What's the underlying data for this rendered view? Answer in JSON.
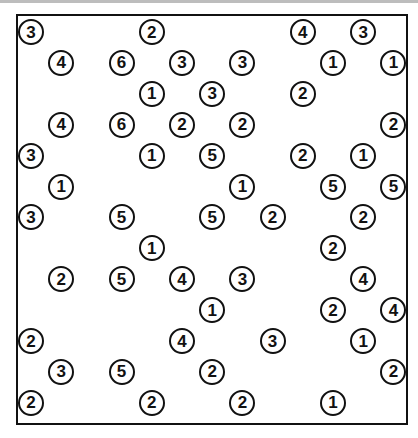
{
  "puzzle": {
    "type": "hashi",
    "rows": 13,
    "cols": 13,
    "origin_px": [
      30,
      31
    ],
    "step_px": [
      30.2,
      30.9
    ],
    "colors": {
      "border": "#111111",
      "background": "#ffffff",
      "island_text": "#111111"
    },
    "islands": [
      {
        "r": 0,
        "c": 0,
        "v": "3"
      },
      {
        "r": 0,
        "c": 4,
        "v": "2"
      },
      {
        "r": 0,
        "c": 9,
        "v": "4"
      },
      {
        "r": 0,
        "c": 11,
        "v": "3"
      },
      {
        "r": 1,
        "c": 1,
        "v": "4"
      },
      {
        "r": 1,
        "c": 3,
        "v": "6"
      },
      {
        "r": 1,
        "c": 5,
        "v": "3"
      },
      {
        "r": 1,
        "c": 7,
        "v": "3"
      },
      {
        "r": 1,
        "c": 10,
        "v": "1"
      },
      {
        "r": 1,
        "c": 12,
        "v": "1"
      },
      {
        "r": 2,
        "c": 4,
        "v": "1"
      },
      {
        "r": 2,
        "c": 6,
        "v": "3"
      },
      {
        "r": 2,
        "c": 9,
        "v": "2"
      },
      {
        "r": 3,
        "c": 1,
        "v": "4"
      },
      {
        "r": 3,
        "c": 3,
        "v": "6"
      },
      {
        "r": 3,
        "c": 5,
        "v": "2"
      },
      {
        "r": 3,
        "c": 7,
        "v": "2"
      },
      {
        "r": 3,
        "c": 12,
        "v": "2"
      },
      {
        "r": 4,
        "c": 0,
        "v": "3"
      },
      {
        "r": 4,
        "c": 4,
        "v": "1"
      },
      {
        "r": 4,
        "c": 6,
        "v": "5"
      },
      {
        "r": 4,
        "c": 9,
        "v": "2"
      },
      {
        "r": 4,
        "c": 11,
        "v": "1"
      },
      {
        "r": 5,
        "c": 1,
        "v": "1"
      },
      {
        "r": 5,
        "c": 7,
        "v": "1"
      },
      {
        "r": 5,
        "c": 10,
        "v": "5"
      },
      {
        "r": 5,
        "c": 12,
        "v": "5"
      },
      {
        "r": 6,
        "c": 0,
        "v": "3"
      },
      {
        "r": 6,
        "c": 3,
        "v": "5"
      },
      {
        "r": 6,
        "c": 6,
        "v": "5"
      },
      {
        "r": 6,
        "c": 8,
        "v": "2"
      },
      {
        "r": 6,
        "c": 11,
        "v": "2"
      },
      {
        "r": 7,
        "c": 4,
        "v": "1"
      },
      {
        "r": 7,
        "c": 10,
        "v": "2"
      },
      {
        "r": 8,
        "c": 1,
        "v": "2"
      },
      {
        "r": 8,
        "c": 3,
        "v": "5"
      },
      {
        "r": 8,
        "c": 5,
        "v": "4"
      },
      {
        "r": 8,
        "c": 7,
        "v": "3"
      },
      {
        "r": 8,
        "c": 11,
        "v": "4"
      },
      {
        "r": 9,
        "c": 6,
        "v": "1"
      },
      {
        "r": 9,
        "c": 10,
        "v": "2"
      },
      {
        "r": 9,
        "c": 12,
        "v": "4"
      },
      {
        "r": 10,
        "c": 0,
        "v": "2"
      },
      {
        "r": 10,
        "c": 5,
        "v": "4"
      },
      {
        "r": 10,
        "c": 8,
        "v": "3"
      },
      {
        "r": 10,
        "c": 11,
        "v": "1"
      },
      {
        "r": 11,
        "c": 1,
        "v": "3"
      },
      {
        "r": 11,
        "c": 3,
        "v": "5"
      },
      {
        "r": 11,
        "c": 6,
        "v": "2"
      },
      {
        "r": 11,
        "c": 12,
        "v": "2"
      },
      {
        "r": 12,
        "c": 0,
        "v": "2"
      },
      {
        "r": 12,
        "c": 4,
        "v": "2"
      },
      {
        "r": 12,
        "c": 7,
        "v": "2"
      },
      {
        "r": 12,
        "c": 10,
        "v": "1"
      }
    ]
  }
}
